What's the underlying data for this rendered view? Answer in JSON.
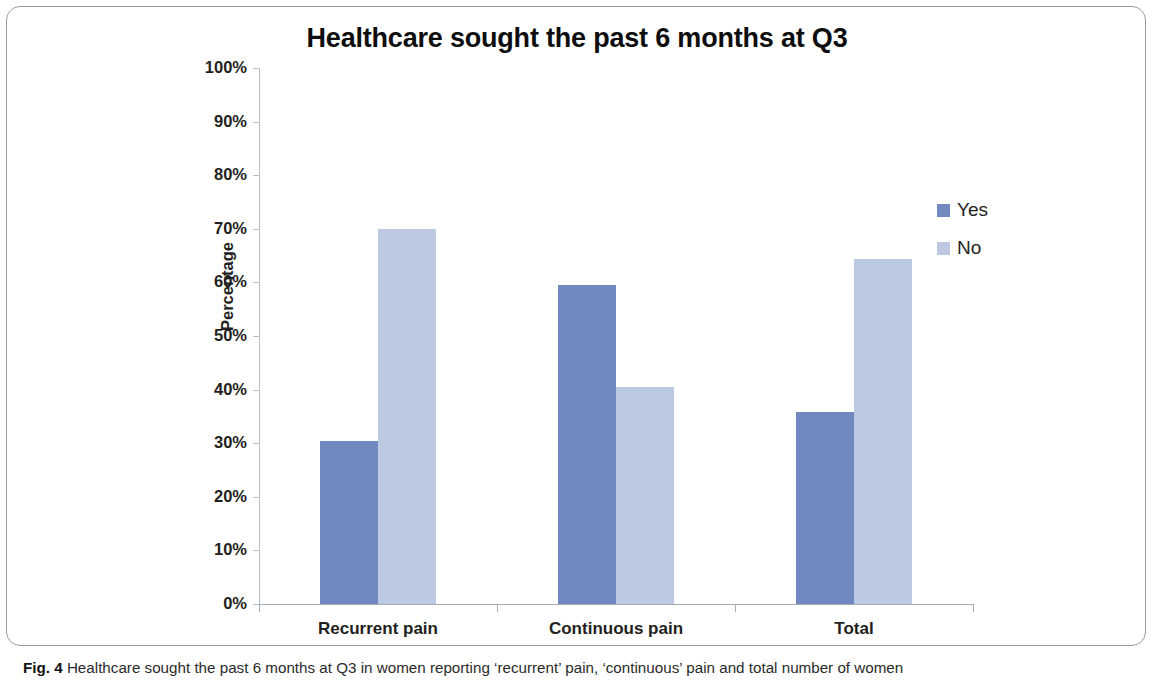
{
  "figure": {
    "caption_prefix": "Fig. 4",
    "caption_text": " Healthcare sought the past 6 months at Q3 in women reporting ‘recurrent’ pain, ‘continuous’ pain and total number of women"
  },
  "colors": {
    "series_yes": "#7189c0",
    "series_no": "#bdc8e3",
    "axis": "#aab0ba",
    "text": "#231f20"
  },
  "chart_data": {
    "type": "bar",
    "title": "Healthcare sought the past 6 months at Q3",
    "xlabel": "",
    "ylabel": "Percentage",
    "categories": [
      "Recurrent pain",
      "Continuous pain",
      "Total"
    ],
    "series": [
      {
        "name": "Yes",
        "color": "#7189c0",
        "values": [
          30.4,
          59.5,
          35.8
        ]
      },
      {
        "name": "No",
        "color": "#bdc8e3",
        "values": [
          70.0,
          40.5,
          64.4
        ]
      }
    ],
    "ylim": [
      0,
      100
    ],
    "yticks": [
      0,
      10,
      20,
      30,
      40,
      50,
      60,
      70,
      80,
      90,
      100
    ],
    "ytick_labels": [
      "0%",
      "10%",
      "20%",
      "30%",
      "40%",
      "50%",
      "60%",
      "70%",
      "80%",
      "90%",
      "100%"
    ],
    "grid": false,
    "legend_position": "right"
  }
}
